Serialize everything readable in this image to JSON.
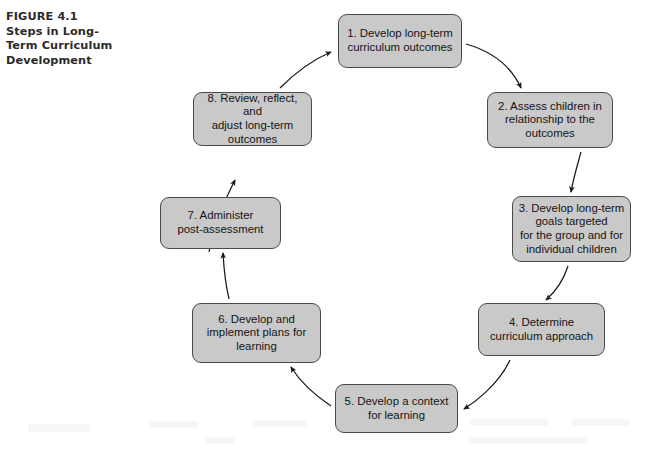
{
  "figure": {
    "caption_lines": [
      "FIGURE 4.1",
      "Steps in Long-",
      "Term Curriculum",
      "Development"
    ],
    "caption_full": "FIGURE 4.1 Steps in Long-Term Curriculum Development",
    "box_fill_color": "#c9c9c9",
    "box_border_color": "#4a4a4a",
    "background_color": "#ffffff",
    "text_color": "#141414",
    "caption_color": "#2b2b2b"
  },
  "diagram": {
    "type": "cycle",
    "direction": "clockwise",
    "step_count": 8,
    "nodes": [
      {
        "id": 1,
        "label": "1. Develop long-term\ncurriculum outcomes"
      },
      {
        "id": 2,
        "label": "2. Assess children in\nrelationship to the\noutcomes"
      },
      {
        "id": 3,
        "label": "3. Develop long-term\ngoals targeted\nfor the group and for\nindividual children"
      },
      {
        "id": 4,
        "label": "4. Determine\ncurriculum approach"
      },
      {
        "id": 5,
        "label": "5. Develop a context\nfor learning"
      },
      {
        "id": 6,
        "label": "6. Develop and\nimplement plans for\nlearning"
      },
      {
        "id": 7,
        "label": "7. Administer\npost-assessment"
      },
      {
        "id": 8,
        "label": "8. Review, reflect, and\nadjust long-term\noutcomes"
      }
    ],
    "edges": [
      {
        "from": 1,
        "to": 2
      },
      {
        "from": 2,
        "to": 3
      },
      {
        "from": 3,
        "to": 4
      },
      {
        "from": 4,
        "to": 5
      },
      {
        "from": 5,
        "to": 6
      },
      {
        "from": 6,
        "to": 7
      },
      {
        "from": 7,
        "to": 8
      },
      {
        "from": 8,
        "to": 1
      }
    ]
  }
}
